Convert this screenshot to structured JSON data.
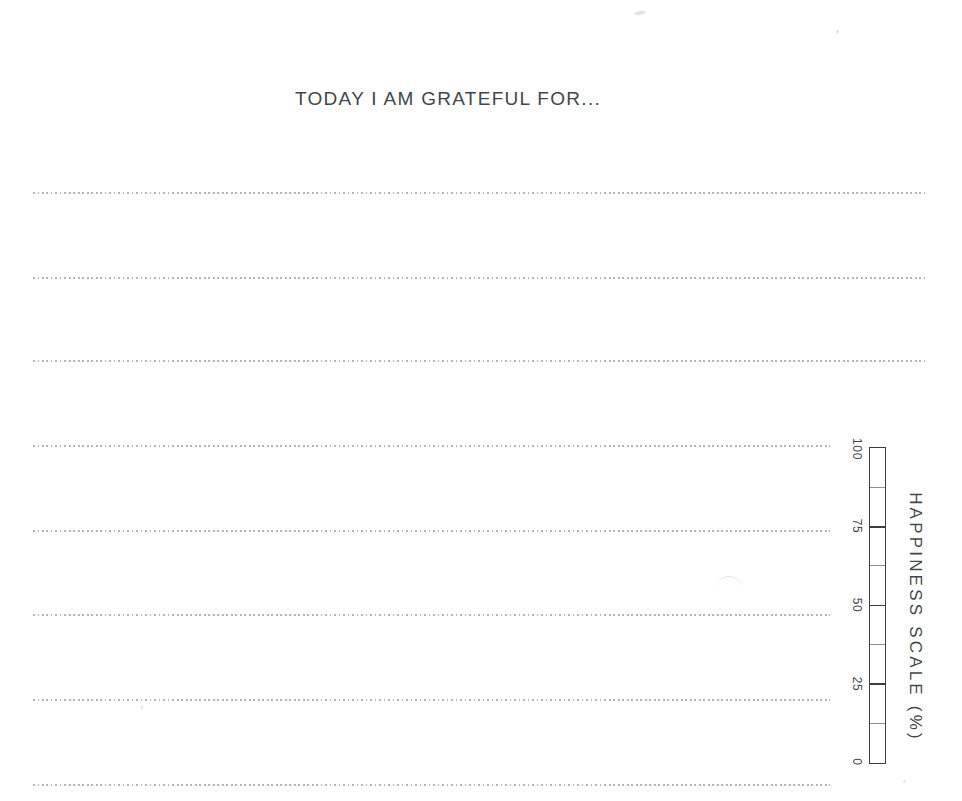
{
  "page": {
    "title": "TODAY I AM GRATEFUL FOR..."
  },
  "journal": {
    "line_count": 8,
    "line_style": "dotted"
  },
  "happiness_scale": {
    "caption": "HAPPINESS SCALE (%)",
    "min": 0,
    "max": 100,
    "major_tick_step": 25,
    "minor_tick_step": 12.5,
    "tick_labels": [
      "100",
      "75",
      "50",
      "25",
      "0"
    ]
  },
  "colors": {
    "ink": "#43474c",
    "dotted_line": "#b3b5b1",
    "paper": "#ffffff"
  }
}
